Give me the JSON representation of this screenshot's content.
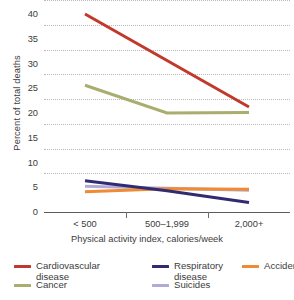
{
  "chart_data": {
    "type": "line",
    "title": "",
    "xlabel": "Physical activity index, calories/week",
    "ylabel": "Percent of total deaths",
    "categories": [
      "< 500",
      "500–1,999",
      "2,000+"
    ],
    "ylim": [
      0,
      40
    ],
    "yticks": [
      0,
      5,
      10,
      15,
      20,
      25,
      30,
      35,
      40
    ],
    "ytick_labels": [
      "0",
      "5",
      "10",
      "15",
      "20",
      "25",
      "30",
      "35",
      "40"
    ],
    "grid": "horizontal-dotted",
    "legend_position": "bottom",
    "series": [
      {
        "name": "Cardiovascular disease",
        "legend_label": "Cardiovascular\ndisease",
        "color": "#c0392b",
        "values": [
          40.0,
          30.6,
          21.2
        ]
      },
      {
        "name": "Cancer",
        "legend_label": "Cancer",
        "color": "#a9ad6e",
        "values": [
          25.6,
          20.0,
          20.1
        ]
      },
      {
        "name": "Respiratory disease",
        "legend_label": "Respiratory\ndisease",
        "color": "#312b72",
        "values": [
          6.3,
          4.3,
          1.9
        ]
      },
      {
        "name": "Suicides",
        "legend_label": "Suicides",
        "color": "#b2aad6",
        "values": [
          5.2,
          4.8,
          4.4
        ]
      },
      {
        "name": "Accidents",
        "legend_label": "Accidents",
        "color": "#ef8b33",
        "values": [
          4.1,
          4.7,
          4.6
        ]
      }
    ]
  },
  "legend": {
    "layout": [
      [
        {
          "series_index": 0
        },
        {
          "series_index": 2
        },
        {
          "series_index": 4
        }
      ],
      [
        {
          "series_index": 1
        },
        {
          "series_index": 3
        }
      ]
    ]
  },
  "colors": {
    "cardiovascular": "#c0392b",
    "cancer": "#a9ad6e",
    "respiratory": "#312b72",
    "suicides": "#b2aad6",
    "accidents": "#ef8b33",
    "axis": "#5c5c5c",
    "gridline": "#b9b9b9",
    "text": "#3c3c3c",
    "background": "#ffffff"
  }
}
